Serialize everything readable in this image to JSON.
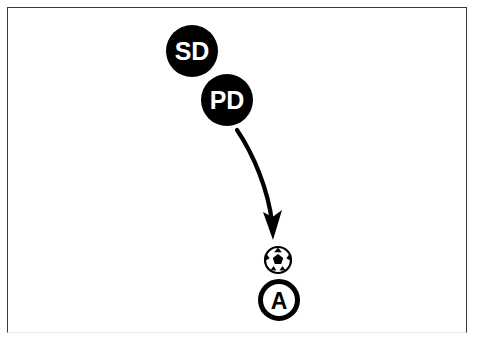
{
  "diagram": {
    "frame": {
      "border_color": "#3a3a3a",
      "background_color": "#ffffff"
    },
    "players": [
      {
        "id": "sd",
        "label": "SD",
        "role": "defender",
        "style": "filled-circle",
        "fill_color": "#000000",
        "text_color": "#ffffff",
        "x": 192,
        "y": 51,
        "radius": 26
      },
      {
        "id": "pd",
        "label": "PD",
        "role": "defender",
        "style": "filled-circle",
        "fill_color": "#000000",
        "text_color": "#ffffff",
        "x": 227,
        "y": 100,
        "radius": 26
      },
      {
        "id": "a",
        "label": "A",
        "role": "attacker",
        "style": "outlined-circle",
        "fill_color": "#ffffff",
        "text_color": "#000000",
        "stroke_color": "#000000",
        "x": 279,
        "y": 300,
        "radius": 21
      }
    ],
    "ball": {
      "label": "soccer-ball",
      "x": 278,
      "y": 260,
      "radius": 13,
      "color": "#000000"
    },
    "arrows": [
      {
        "id": "pass-arrow",
        "kind": "curved-movement-arrow",
        "color": "#000000",
        "from_x": 237,
        "from_y": 130,
        "to_x": 273,
        "to_y": 237
      }
    ]
  }
}
